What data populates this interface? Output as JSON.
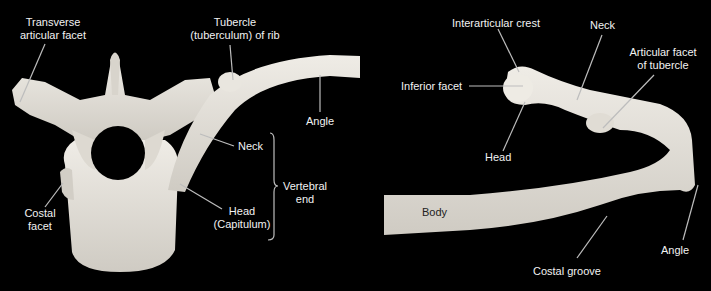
{
  "figure": {
    "panels": [
      {
        "id": "vertebra-rib-articulation",
        "labels": {
          "transverse_facet": "Transverse\narticular facet",
          "tubercle": "Tubercle\n(tuberculum) of rib",
          "angle": "Angle",
          "neck": "Neck",
          "vertebral_end": "Vertebral\nend",
          "head": "Head\n(Capitulum)",
          "costal_facet": "Costal\nfacet"
        }
      },
      {
        "id": "isolated-rib",
        "labels": {
          "interarticular_crest": "Interarticular crest",
          "neck": "Neck",
          "articular_facet_tubercle": "Articular facet\nof tubercle",
          "inferior_facet": "Inferior facet",
          "head": "Head",
          "body": "Body",
          "angle": "Angle",
          "costal_groove": "Costal groove"
        }
      }
    ],
    "colors": {
      "background": "#000000",
      "bone": "#e6e3dc",
      "leader": "#bdbdbd",
      "text": "#f2f2f2"
    }
  }
}
